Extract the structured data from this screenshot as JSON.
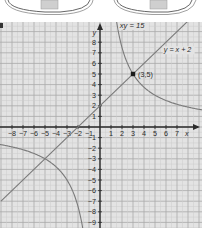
{
  "chart_data": {
    "type": "line",
    "title": "",
    "xlabel": "x",
    "ylabel": "y",
    "xlim": [
      -9,
      9.2
    ],
    "ylim": [
      -9.5,
      9.8
    ],
    "grid": true,
    "x_ticks": [
      -8,
      -7,
      -6,
      -5,
      -4,
      -3,
      -2,
      -1,
      1,
      2,
      3,
      4,
      5,
      6,
      7
    ],
    "y_ticks": [
      8,
      7,
      6,
      5,
      4,
      3,
      2,
      1,
      -1,
      -2,
      -3,
      -4,
      -5,
      -6,
      -7,
      -8,
      -9
    ],
    "series": [
      {
        "name": "xy = 15",
        "kind": "hyperbola",
        "equation": "xy = 15",
        "label": "xy = 15"
      },
      {
        "name": "y = x + 2",
        "kind": "line",
        "equation": "y = x + 2",
        "label": "y = x + 2",
        "points": [
          [
            -9,
            -7
          ],
          [
            8,
            10
          ]
        ]
      }
    ],
    "annotations": [
      {
        "point": [
          3,
          5
        ],
        "label": "(3,5)",
        "marker": true
      },
      {
        "point": [
          -5,
          -3
        ],
        "label": "",
        "marker": false
      }
    ]
  },
  "labels": {
    "hyperbola": "xy = 15",
    "line": "y = x + 2",
    "intersection": "(3,5)",
    "x_axis": "x",
    "y_axis": "y"
  },
  "colors": {
    "background": "#e3e3e3",
    "grid_minor": "#cdcdcd",
    "grid_major": "#a9a9a9",
    "axis": "#2b2b2b",
    "curve": "#7a7a7a",
    "text": "#2a2a2a"
  }
}
